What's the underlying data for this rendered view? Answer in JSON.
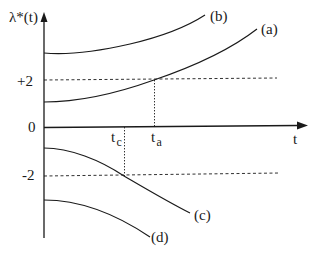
{
  "diagram": {
    "y_axis_label": "λ*(t)",
    "x_axis_label": "t",
    "origin_label": "0",
    "y_ticks": [
      {
        "label": "+2",
        "value": 2
      },
      {
        "label": "-2",
        "value": -2
      }
    ],
    "x_markers": [
      {
        "label": "t",
        "subscript": "c",
        "note": "curve (c) crosses -2"
      },
      {
        "label": "t",
        "subscript": "a",
        "note": "curve (a) crosses +2"
      }
    ],
    "curves": [
      {
        "label": "(a)",
        "description": "starts between 0 and +2, increases, crosses +2 at t_a"
      },
      {
        "label": "(b)",
        "description": "starts above +2, increases"
      },
      {
        "label": "(c)",
        "description": "starts between 0 and -2, decreases, crosses -2 at t_c"
      },
      {
        "label": "(d)",
        "description": "starts below -2, decreases"
      }
    ],
    "colors": {
      "ink": "#1a1a1a",
      "background": "#ffffff"
    }
  }
}
